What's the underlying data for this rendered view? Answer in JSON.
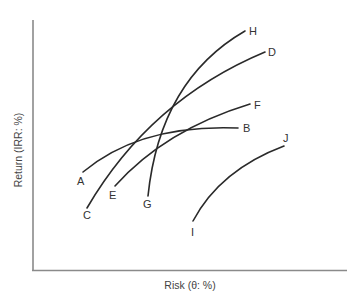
{
  "figure": {
    "x_axis_label": "Risk (θ: %)",
    "y_axis_label": "Return (IRR: %)"
  },
  "colors": {
    "axis": "#8a8a8a",
    "curve": "#2a2a2a",
    "text": "#333333",
    "background": "#ffffff"
  },
  "curves": [
    {
      "id": "AB",
      "start_label": "A",
      "end_label": "B",
      "start": [
        83,
        172
      ],
      "ctrl": [
        140,
        124
      ],
      "end": [
        238,
        128
      ]
    },
    {
      "id": "CD",
      "start_label": "C",
      "end_label": "D",
      "start": [
        87,
        208
      ],
      "ctrl": [
        150,
        100
      ],
      "end": [
        265,
        52
      ]
    },
    {
      "id": "EF",
      "start_label": "E",
      "end_label": "F",
      "start": [
        115,
        186
      ],
      "ctrl": [
        165,
        130
      ],
      "end": [
        250,
        104
      ]
    },
    {
      "id": "GH",
      "start_label": "G",
      "end_label": "H",
      "start": [
        148,
        196
      ],
      "ctrl": [
        160,
        80
      ],
      "end": [
        245,
        31
      ]
    },
    {
      "id": "IJ",
      "start_label": "I",
      "end_label": "J",
      "start": [
        193,
        221
      ],
      "ctrl": [
        220,
        170
      ],
      "end": [
        284,
        146
      ]
    }
  ],
  "labels": [
    {
      "text": "A",
      "x": 77,
      "y": 185
    },
    {
      "text": "B",
      "x": 243,
      "y": 132
    },
    {
      "text": "C",
      "x": 83,
      "y": 219
    },
    {
      "text": "D",
      "x": 268,
      "y": 56
    },
    {
      "text": "E",
      "x": 109,
      "y": 199
    },
    {
      "text": "F",
      "x": 254,
      "y": 109
    },
    {
      "text": "G",
      "x": 143,
      "y": 208
    },
    {
      "text": "H",
      "x": 249,
      "y": 35
    },
    {
      "text": "I",
      "x": 191,
      "y": 236
    },
    {
      "text": "J",
      "x": 283,
      "y": 142
    }
  ]
}
